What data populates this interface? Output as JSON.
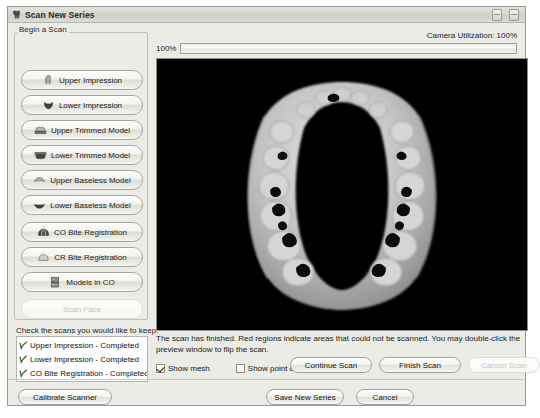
{
  "window": {
    "title": "Scan New Series",
    "title_icon": "tooth-icon",
    "controls": [
      {
        "name": "minimize-button",
        "glyph": "minimize-icon"
      },
      {
        "name": "close-button",
        "glyph": "close-icon"
      }
    ]
  },
  "left_panel": {
    "group_label": "Begin a Scan",
    "buttons": [
      {
        "label": "Upper Impression",
        "icon": "upper-impression-icon",
        "disabled": false
      },
      {
        "label": "Lower Impression",
        "icon": "lower-impression-icon",
        "disabled": false
      },
      {
        "label": "Upper Trimmed Model",
        "icon": "upper-trimmed-model-icon",
        "disabled": false
      },
      {
        "label": "Lower Trimmed Model",
        "icon": "lower-trimmed-model-icon",
        "disabled": false
      },
      {
        "label": "Upper Baseless Model",
        "icon": "upper-baseless-model-icon",
        "disabled": false
      },
      {
        "label": "Lower Baseless Model",
        "icon": "lower-baseless-model-icon",
        "disabled": false
      },
      {
        "label": "CO Bite Registration",
        "icon": "co-bite-registration-icon",
        "disabled": false
      },
      {
        "label": "CR Bite Registration",
        "icon": "cr-bite-registration-icon",
        "disabled": false
      },
      {
        "label": "Models in CO",
        "icon": "models-in-co-icon",
        "disabled": false
      },
      {
        "label": "Scan Face",
        "icon": "",
        "disabled": true
      }
    ],
    "keep_label": "Check the scans you would like to keep:",
    "keep_items": [
      {
        "label": "Upper Impression - Completed",
        "checked": true
      },
      {
        "label": "Lower Impression - Completed",
        "checked": true
      },
      {
        "label": "CO Bite Registration - Completed",
        "checked": true
      }
    ]
  },
  "main": {
    "camera_utilization": "Camera Utilization: 100%",
    "progress_percent_label": "100%",
    "progress_value": 100,
    "preview_alt": "3D dental arch scan preview",
    "status_text": "The scan has finished.  Red regions indicate areas that could not be scanned.  You may double-click the preview window to flip the scan.",
    "options": [
      {
        "label": "Show mesh",
        "checked": true,
        "name": "show-mesh-checkbox"
      },
      {
        "label": "Show point cloud",
        "checked": false,
        "name": "show-point-cloud-checkbox"
      }
    ],
    "scan_buttons": [
      {
        "label": "Continue Scan",
        "disabled": false,
        "name": "continue-scan-button"
      },
      {
        "label": "Finish Scan",
        "disabled": false,
        "name": "finish-scan-button"
      },
      {
        "label": "Cancel Scan",
        "disabled": true,
        "name": "cancel-scan-button"
      }
    ]
  },
  "footer": {
    "calibrate_label": "Calibrate Scanner",
    "save_label": "Save New Series",
    "cancel_label": "Cancel"
  },
  "colors": {
    "window_bg": "#ecece7",
    "preview_bg": "#000000",
    "title_bar": "#d7d7d0",
    "border": "#9a9a94",
    "check_mark": "#2e6b2e"
  }
}
